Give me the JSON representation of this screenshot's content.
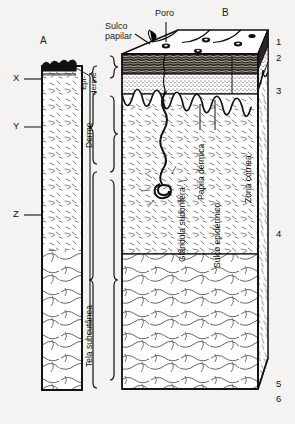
{
  "figure": {
    "title_absent": true,
    "language": "pt-BR",
    "background_color": "#f4f3f1",
    "ink_color": "#111111"
  },
  "panels": {
    "a_label": "A",
    "b_label": "B"
  },
  "callouts": {
    "sulco_papilar": "Sulco\npapilar",
    "poro": "Poro"
  },
  "layer_brackets": [
    {
      "id": "epiderme",
      "line1": "Epi-",
      "line2": "derme"
    },
    {
      "id": "derme",
      "text": "Derme"
    },
    {
      "id": "tela_subcutanea",
      "text": "Tela subcutânea"
    }
  ],
  "inner_labels": [
    {
      "id": "glandula-sudorifera",
      "text": "Glândula sudorífera"
    },
    {
      "id": "papila-dermica",
      "text": "Papila dérmica"
    },
    {
      "id": "sulco-epidermico",
      "text": "Sulco epidérmico"
    },
    {
      "id": "zona-cornea",
      "text": "Zona córnea"
    }
  ],
  "left_markers": [
    {
      "id": "x",
      "label": "X"
    },
    {
      "id": "y",
      "label": "Y"
    },
    {
      "id": "z",
      "label": "Z"
    }
  ],
  "right_numbers": [
    {
      "id": "n1",
      "label": "1"
    },
    {
      "id": "n2",
      "label": "2"
    },
    {
      "id": "n3",
      "label": "3"
    },
    {
      "id": "n4",
      "label": "4"
    },
    {
      "id": "n5",
      "label": "5"
    },
    {
      "id": "n6",
      "label": "6"
    }
  ]
}
